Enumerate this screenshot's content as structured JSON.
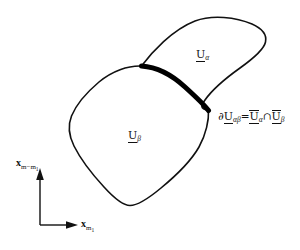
{
  "figure": {
    "background_color": "#ffffff",
    "stroke_color": "#111111"
  },
  "regions": [
    {
      "id": "alpha",
      "symbol": "U",
      "subscript": "α",
      "label_text": "U",
      "position": {
        "x": 196,
        "y": 49
      }
    },
    {
      "id": "beta",
      "symbol": "U",
      "subscript": "β",
      "label_text": "U",
      "position": {
        "x": 128,
        "y": 130
      }
    }
  ],
  "boundary": {
    "name": "shared-boundary",
    "stroke_width": 5,
    "color": "#000000",
    "equation": {
      "partial": "∂",
      "lhs_symbol": "U",
      "lhs_subscript": "αβ",
      "equals": "=",
      "rhs_first_symbol": "U",
      "rhs_first_subscript": "α",
      "intersect": "∩",
      "rhs_second_symbol": "U",
      "rhs_second_subscript": "β",
      "full_text": "∂U_{αβ} = Ū_{α} ∩ Ū_{β}"
    }
  },
  "axes": {
    "y_axis": {
      "symbol": "x",
      "subscript": "m−m",
      "sub_subscript": "1",
      "full_text": "x_{m−m₁}"
    },
    "x_axis": {
      "symbol": "x",
      "subscript": "m",
      "sub_subscript": "1",
      "full_text": "x_{m₁}"
    }
  }
}
